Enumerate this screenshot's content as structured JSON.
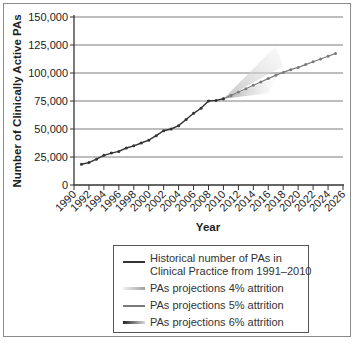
{
  "chart_data": {
    "type": "line",
    "title": "",
    "xlabel": "Year",
    "ylabel": "Number of Clinically Active PAs",
    "ylim": [
      0,
      150000
    ],
    "xlim": [
      1990,
      2026
    ],
    "grid": "horizontal",
    "legend_position": "bottom",
    "y_ticks": [
      "0",
      "25,000",
      "50,000",
      "75,000",
      "100,000",
      "125,000",
      "150,000"
    ],
    "x_ticks": [
      "1990",
      "1992",
      "1994",
      "1996",
      "1998",
      "2000",
      "2002",
      "2004",
      "2006",
      "2008",
      "2010",
      "2012",
      "2014",
      "2016",
      "2018",
      "2020",
      "2022",
      "2024",
      "2026"
    ],
    "series": [
      {
        "name": "Historical number of PAs in Clinical Practice from 1991–2010",
        "style": "solid-dark",
        "x": [
          1991,
          1992,
          1993,
          1994,
          1995,
          1996,
          1997,
          1998,
          1999,
          2000,
          2001,
          2002,
          2003,
          2004,
          2005,
          2006,
          2007,
          2008,
          2009,
          2010
        ],
        "values": [
          18500,
          20000,
          23000,
          26500,
          28500,
          30000,
          33000,
          35000,
          37500,
          40000,
          44000,
          48500,
          50000,
          53000,
          58500,
          64000,
          68500,
          75000,
          75500,
          77000
        ]
      },
      {
        "name": "PAs projections 4% attrition",
        "style": "light-gradient-band",
        "x": [
          2010,
          2017
        ],
        "values": [
          77000,
          116000
        ]
      },
      {
        "name": "PAs projections 5% attrition",
        "style": "solid-grey-markers",
        "x": [
          2010,
          2011,
          2012,
          2013,
          2014,
          2015,
          2016,
          2017,
          2018,
          2019,
          2020,
          2021,
          2022,
          2023,
          2024,
          2025
        ],
        "values": [
          77000,
          80000,
          83000,
          86000,
          89000,
          92000,
          95000,
          98000,
          100500,
          103000,
          105000,
          107500,
          110000,
          112500,
          115000,
          117500
        ]
      },
      {
        "name": "PAs projections 6% attrition",
        "style": "dark-gradient-band",
        "x": [
          2010,
          2017
        ],
        "values": [
          77000,
          90000
        ]
      }
    ]
  },
  "legend": {
    "items": [
      {
        "line1": "Historical number of PAs in",
        "line2": "Clinical Practice from 1991–2010"
      },
      {
        "line1": "PAs projections 4% attrition"
      },
      {
        "line1": "PAs projections 5% attrition"
      },
      {
        "line1": "PAs projections 6% attrition"
      }
    ]
  },
  "axes": {
    "y_title": "Number of Clinically Active PAs",
    "x_title": "Year"
  },
  "colors": {
    "historical": "#333333",
    "proj5": "#7a7a7a",
    "grid": "#6e6e6e"
  }
}
